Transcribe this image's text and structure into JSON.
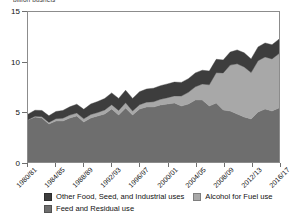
{
  "chart_data": {
    "type": "area",
    "title": "",
    "ylabel": "billion bushels",
    "xlabel": "",
    "ylim": [
      0,
      15
    ],
    "yticks": [
      "0",
      "5",
      "10",
      "15"
    ],
    "ytick_values": [
      0,
      5,
      10,
      15
    ],
    "grid": false,
    "stacked": true,
    "legend_position": "bottom",
    "x": [
      "1980/81",
      "1981/82",
      "1982/83",
      "1983/84",
      "1984/85",
      "1985/86",
      "1986/87",
      "1987/88",
      "1988/89",
      "1989/90",
      "1990/91",
      "1991/92",
      "1992/93",
      "1993/94",
      "1994/95",
      "1995/96",
      "1996/97",
      "1997/98",
      "1998/99",
      "1999/00",
      "2000/01",
      "2001/02",
      "2002/03",
      "2003/04",
      "2004/05",
      "2005/06",
      "2006/07",
      "2007/08",
      "2008/09",
      "2009/10",
      "2010/11",
      "2011/12",
      "2012/13",
      "2013/14",
      "2014/15",
      "2015/16",
      "2016/17"
    ],
    "xtick_labels": [
      "1980/81",
      "1984/85",
      "1988/89",
      "1992/93",
      "1996/97",
      "2000/01",
      "2004/05",
      "2008/09",
      "2012/13",
      "2016/17"
    ],
    "xtick_indices": [
      0,
      4,
      8,
      12,
      16,
      20,
      24,
      28,
      32,
      36
    ],
    "series": [
      {
        "name": "Feed and Residual use",
        "color": "#6e6e6e",
        "values": [
          4.2,
          4.5,
          4.4,
          3.8,
          4.1,
          4.1,
          4.4,
          4.6,
          4.0,
          4.4,
          4.6,
          4.8,
          5.3,
          4.7,
          5.4,
          4.7,
          5.3,
          5.5,
          5.5,
          5.7,
          5.8,
          5.9,
          5.6,
          5.8,
          6.2,
          6.2,
          5.6,
          5.9,
          5.2,
          5.1,
          4.8,
          4.5,
          4.3,
          5.0,
          5.3,
          5.1,
          5.4
        ]
      },
      {
        "name": "Alcohol for Fuel use",
        "color": "#a8a8a8",
        "values": [
          0.03,
          0.08,
          0.13,
          0.16,
          0.23,
          0.28,
          0.29,
          0.3,
          0.32,
          0.35,
          0.35,
          0.4,
          0.43,
          0.46,
          0.53,
          0.4,
          0.43,
          0.48,
          0.53,
          0.57,
          0.63,
          0.71,
          1.0,
          1.17,
          1.32,
          1.6,
          2.12,
          3.03,
          3.71,
          4.59,
          5.02,
          5.01,
          4.64,
          5.13,
          5.2,
          5.21,
          5.44
        ]
      },
      {
        "name": "Other Food, Seed, and Industrial uses",
        "color": "#3d3d3d",
        "values": [
          0.55,
          0.6,
          0.62,
          0.66,
          0.72,
          0.78,
          0.83,
          0.88,
          0.95,
          1.05,
          1.1,
          1.15,
          1.18,
          1.2,
          1.25,
          1.26,
          1.3,
          1.32,
          1.35,
          1.36,
          1.38,
          1.38,
          1.36,
          1.36,
          1.39,
          1.38,
          1.37,
          1.34,
          1.3,
          1.3,
          1.39,
          1.41,
          1.37,
          1.38,
          1.4,
          1.42,
          1.44
        ]
      }
    ],
    "series_totals": [
      4.78,
      5.18,
      5.15,
      4.62,
      5.05,
      5.16,
      5.52,
      5.78,
      5.27,
      5.8,
      6.05,
      6.35,
      6.91,
      6.36,
      7.18,
      6.36,
      7.03,
      7.3,
      7.38,
      7.63,
      7.81,
      7.99,
      7.96,
      8.33,
      8.91,
      9.18,
      9.09,
      10.27,
      10.21,
      10.99,
      11.21,
      10.92,
      10.31,
      11.51,
      11.9,
      11.73,
      12.28
    ]
  },
  "legend": {
    "items": [
      {
        "label": "Other Food, Seed, and Industrial uses",
        "color": "#3d3d3d"
      },
      {
        "label": "Alcohol for Fuel use",
        "color": "#a8a8a8"
      },
      {
        "label": "Feed and Residual use",
        "color": "#6e6e6e"
      }
    ]
  }
}
